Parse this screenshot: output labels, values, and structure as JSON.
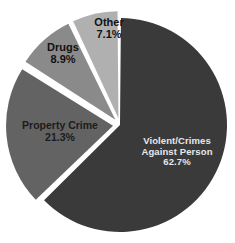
{
  "chart_data": {
    "type": "pie",
    "title": "",
    "subtitle": "",
    "xlabel": "",
    "ylabel": "",
    "grid": false,
    "legend": "none",
    "labels_inside_slices": true,
    "exploded": true,
    "start_angle_deg": 0,
    "direction": "clockwise",
    "background_color": "#ffffff",
    "categories": [
      "Violent/Crimes Against Person",
      "Property Crime",
      "Drugs",
      "Other"
    ],
    "values": [
      62.7,
      21.3,
      8.9,
      7.1
    ],
    "value_suffix": "%",
    "slices": [
      {
        "name": "Violent/Crimes Against Person",
        "name_line_1": "Violent/Crimes",
        "name_line_2": "Against Person",
        "value": 62.7,
        "value_label": "62.7%",
        "color": "#3a3a3a",
        "text_color": "#e8e8e8",
        "exploded": false
      },
      {
        "name": "Property Crime",
        "name_line_1": "Property Crime",
        "name_line_2": "",
        "value": 21.3,
        "value_label": "21.3%",
        "color": "#636363",
        "text_color": "#1c1c1c",
        "exploded": true
      },
      {
        "name": "Drugs",
        "name_line_1": "Drugs",
        "name_line_2": "",
        "value": 8.9,
        "value_label": "8.9%",
        "color": "#8a8a8a",
        "text_color": "#111111",
        "exploded": true
      },
      {
        "name": "Other",
        "name_line_1": "Other",
        "name_line_2": "",
        "value": 7.1,
        "value_label": "7.1%",
        "color": "#b0b0b0",
        "text_color": "#111111",
        "exploded": true
      }
    ]
  }
}
